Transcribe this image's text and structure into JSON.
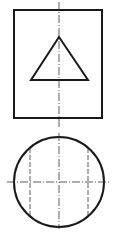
{
  "diagram": {
    "type": "orthographic-projection",
    "views": [
      {
        "name": "front-view",
        "shapes": [
          "rectangle",
          "triangle",
          "vertical-centerline"
        ]
      },
      {
        "name": "top-view",
        "shapes": [
          "circle",
          "horizontal-centerline",
          "vertical-centerline",
          "hidden-lines"
        ]
      }
    ],
    "stroke_color": "#1a1a1a",
    "background": "#ffffff"
  }
}
